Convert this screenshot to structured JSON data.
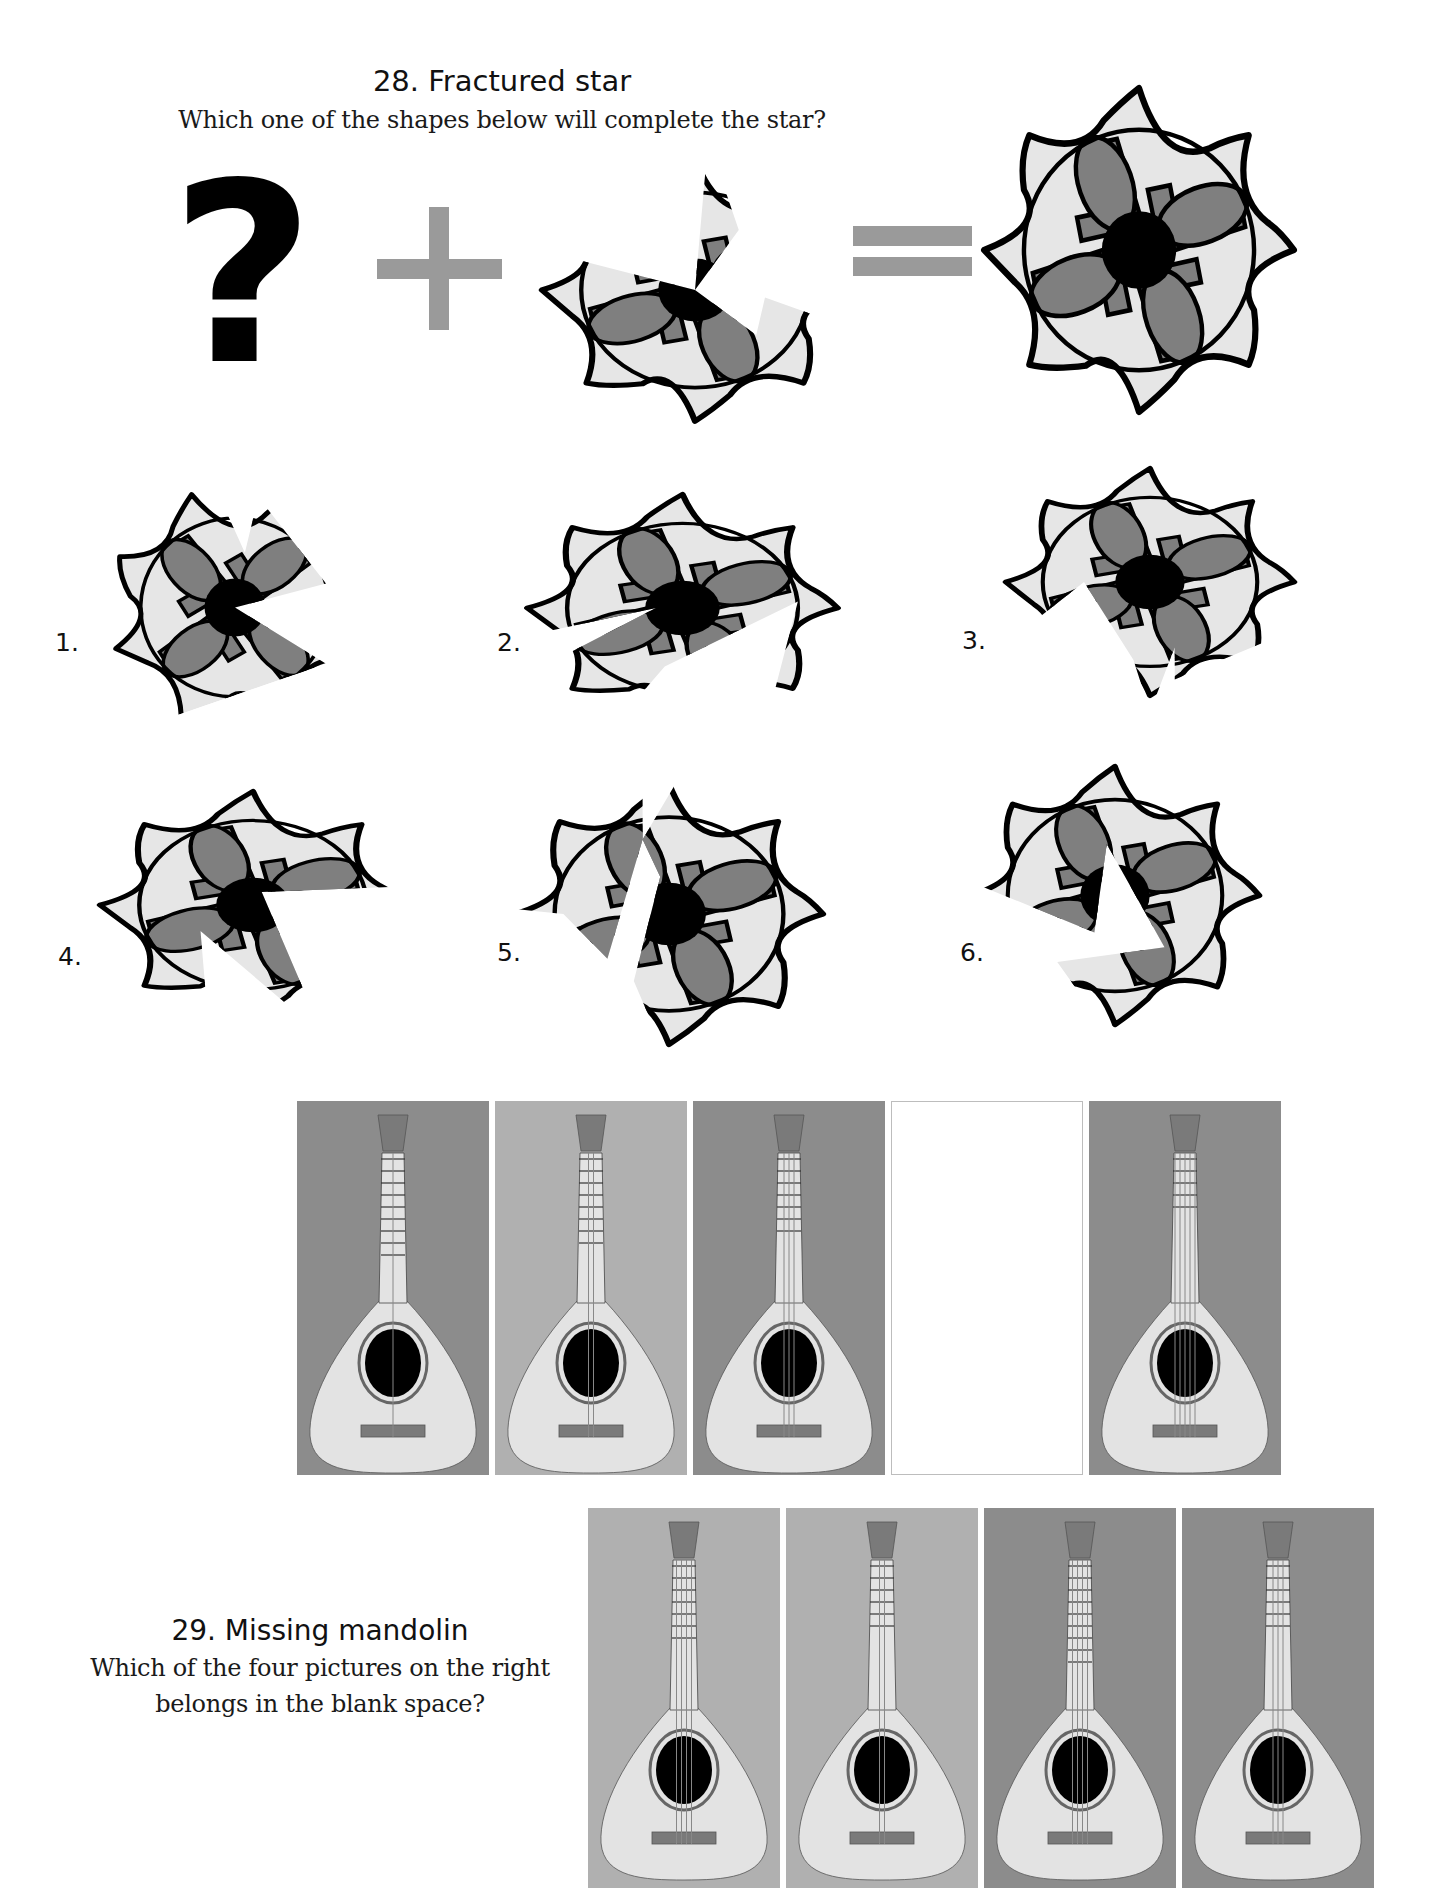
{
  "puzzle28": {
    "title": "28. Fractured star",
    "question": "Which one of the shapes below will complete the star?",
    "equation": {
      "unknown_symbol": "?",
      "operator": "plus",
      "result": "equals"
    },
    "options": [
      {
        "label": "1."
      },
      {
        "label": "2."
      },
      {
        "label": "3."
      },
      {
        "label": "4."
      },
      {
        "label": "5."
      },
      {
        "label": "6."
      }
    ],
    "colors": {
      "light_fill": "#e6e6e6",
      "mid_fill": "#7f7f7f",
      "outline": "#000000",
      "operator": "#9a9a9a"
    }
  },
  "puzzle29": {
    "title": "29. Missing mandolin",
    "question_line1": "Which of the four pictures on the right",
    "question_line2": "belongs in the blank space?",
    "sequence": [
      {
        "background": "dark",
        "strings": 1,
        "frets": 9
      },
      {
        "background": "light",
        "strings": 2,
        "frets": 8
      },
      {
        "background": "dark",
        "strings": 3,
        "frets": 7
      },
      {
        "blank": true
      },
      {
        "background": "dark",
        "strings": 5,
        "frets": 5
      }
    ],
    "choices": [
      {
        "background": "light",
        "strings": 4,
        "frets": 7
      },
      {
        "background": "light",
        "strings": 2,
        "frets": 6
      },
      {
        "background": "dark",
        "strings": 4,
        "frets": 9
      },
      {
        "background": "dark",
        "strings": 3,
        "frets": 6
      }
    ],
    "colors": {
      "dark_bg": "#8c8c8c",
      "light_bg": "#b0b0b0",
      "body": "#e3e3e3",
      "sound_hole": "#000000",
      "bridge": "#7a7a7a",
      "headstock": "#7a7a7a"
    }
  }
}
